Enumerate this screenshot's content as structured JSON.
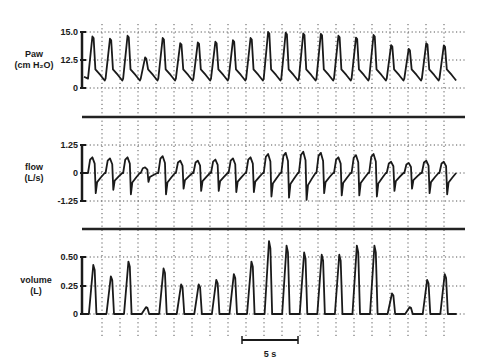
{
  "chart_data": [
    {
      "type": "line",
      "title": "",
      "ylabel": "Paw (cm H2O)",
      "ylabel_lines": [
        "Paw",
        "(cm H₂O)"
      ],
      "yticks": [
        "15.0",
        "12.5",
        "0"
      ],
      "ylim": [
        0,
        15.0
      ],
      "grid": true,
      "breath_peaks": [
        13.8,
        13.2,
        14.0,
        8.2,
        13.4,
        12.0,
        12.2,
        12.4,
        12.8,
        13.4,
        15.0,
        14.8,
        14.6,
        14.5,
        14.0,
        13.5,
        14.2,
        11.5,
        10.5,
        12.0,
        11.4
      ]
    },
    {
      "type": "line",
      "title": "",
      "ylabel": "flow (L/s)",
      "ylabel_lines": [
        "flow",
        "(L/s)"
      ],
      "yticks": [
        "1.25",
        "0",
        "-1.25"
      ],
      "ylim": [
        -1.25,
        1.25
      ],
      "grid": true,
      "breath_peaks": [
        0.7,
        0.65,
        0.7,
        0.25,
        0.75,
        0.55,
        0.55,
        0.6,
        0.65,
        0.7,
        0.85,
        0.9,
        0.95,
        0.9,
        0.7,
        0.8,
        0.85,
        0.5,
        0.45,
        0.55,
        0.5
      ],
      "breath_troughs": [
        -0.9,
        -0.75,
        -0.95,
        -0.4,
        -0.95,
        -0.7,
        -0.8,
        -0.8,
        -0.85,
        -0.85,
        -1.05,
        -1.1,
        -1.2,
        -0.9,
        -1.0,
        -1.0,
        -1.05,
        -0.8,
        -0.7,
        -0.9,
        -0.95
      ]
    },
    {
      "type": "line",
      "title": "",
      "ylabel": "volume (L)",
      "ylabel_lines": [
        "volume",
        "(L)"
      ],
      "yticks": [
        "0.50",
        "0.25",
        "0"
      ],
      "ylim": [
        0,
        0.5
      ],
      "grid": true,
      "breath_peaks": [
        0.43,
        0.33,
        0.46,
        0.06,
        0.4,
        0.26,
        0.26,
        0.3,
        0.35,
        0.46,
        0.64,
        0.6,
        0.54,
        0.52,
        0.52,
        0.6,
        0.6,
        0.18,
        0.06,
        0.3,
        0.35
      ]
    }
  ],
  "scale_bar": {
    "label": "5 s",
    "seconds": 5
  },
  "colors": {
    "trace": "#1a1a1a",
    "grid": "#555555",
    "separator": "#222222"
  }
}
